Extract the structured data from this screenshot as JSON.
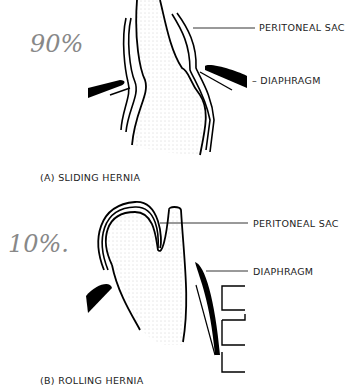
{
  "figures": [
    {
      "id": "A",
      "caption": "(A) SLIDING HERNIA",
      "annotation": "90%",
      "labels": {
        "peritoneal_sac": "PERITONEAL SAC",
        "diaphragm": "– DIAPHRAGM"
      }
    },
    {
      "id": "B",
      "caption": "(B) ROLLING HERNIA",
      "annotation": "10%.",
      "labels": {
        "peritoneal_sac": "PERITONEAL SAC",
        "diaphragm": "DIAPHRAGM"
      }
    }
  ]
}
